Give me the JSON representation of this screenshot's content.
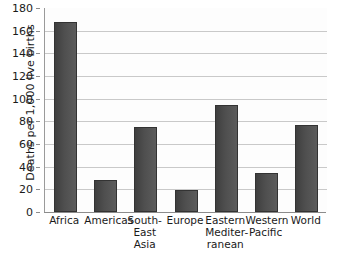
{
  "chart_data": {
    "type": "bar",
    "title": "",
    "subtitle": "",
    "xlabel": "",
    "ylabel": "Deaths per 1,000 live births",
    "categories": [
      "Africa",
      "South-\nEast\nAsia",
      "Americas",
      "Europe",
      "Eastern\nMediter-\nranean",
      "Western\nPacific",
      "World"
    ],
    "category_order": [
      "Africa",
      "Americas",
      "South-\nEast\nAsia",
      "Europe",
      "Eastern\nMediter-\nranean",
      "Western\nPacific",
      "World"
    ],
    "values": [
      168,
      28,
      75,
      19,
      94,
      34,
      77
    ],
    "ylim": [
      0,
      180
    ],
    "yticks": [
      0,
      20,
      40,
      60,
      80,
      100,
      120,
      140,
      160,
      180
    ],
    "ytick_labels": [
      "0",
      "20",
      "40",
      "60",
      "80",
      "100",
      "120",
      "140",
      "160",
      "180"
    ],
    "grid": true,
    "grid_axis": "y",
    "legend": false,
    "legend_position": "none",
    "bar_color": "#4a4a4a",
    "grid_color": "#c9c9c9",
    "axis_color": "#8c8c8c",
    "background_color": "#fdfdfd"
  },
  "axis": {
    "y_title": "Deaths per 1,000 live births"
  }
}
